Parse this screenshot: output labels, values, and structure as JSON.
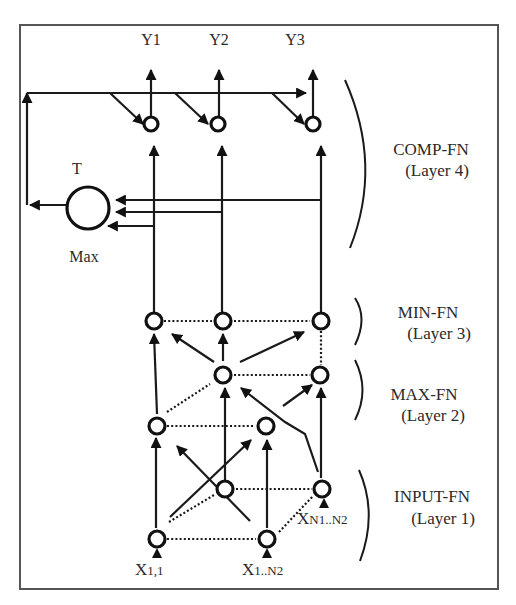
{
  "diagram": {
    "outputs": [
      "Y1",
      "Y2",
      "Y3"
    ],
    "comparator": {
      "top_label": "T",
      "bottom_label": "Max"
    },
    "layers": [
      {
        "name": "COMP-FN",
        "sub": "(Layer 4)"
      },
      {
        "name": "MIN-FN",
        "sub": "(Layer 3)"
      },
      {
        "name": "MAX-FN",
        "sub": "(Layer 2)"
      },
      {
        "name": "INPUT-FN",
        "sub": "(Layer 1)"
      }
    ],
    "inputs": [
      {
        "main": "X",
        "sub": "1,1"
      },
      {
        "main": "X",
        "sub": "1..N2"
      },
      {
        "main": "X",
        "sub": "N1..N2"
      }
    ]
  }
}
